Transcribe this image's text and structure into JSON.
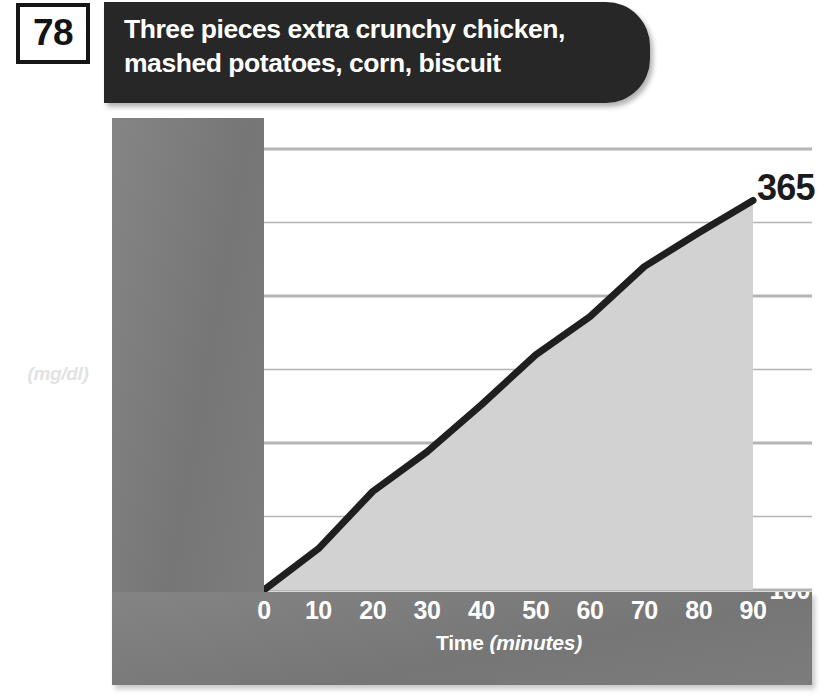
{
  "page": {
    "badge_number": "78",
    "title": "Three pieces extra crunchy chicken,\nmashed potatoes, corn, biscuit"
  },
  "axes": {
    "y_title": "Rise in\nBlood\nSugar",
    "y_units": "(mg/dl)",
    "x_title_main": "Time ",
    "x_title_units": "(minutes)"
  },
  "callout": {
    "end_value": "365"
  },
  "colors": {
    "header_band": "#272727",
    "chassis_gray": "#7b7b7b",
    "plot_background": "#ffffff",
    "area_fill": "#d2d2d2",
    "line_stroke": "#1f1f1f",
    "gridline": "#b4b4b4",
    "tick_text": "#ffffff",
    "callout_text": "#1b1b1b"
  },
  "chart_data": {
    "type": "area",
    "title": "Three pieces extra crunchy chicken, mashed potatoes, corn, biscuit",
    "xlabel": "Time (minutes)",
    "ylabel": "Rise in Blood Sugar (mg/dl)",
    "xlim": [
      0,
      90
    ],
    "ylim": [
      100,
      400
    ],
    "grid": true,
    "legend": "none",
    "x": [
      0,
      10,
      20,
      30,
      40,
      50,
      60,
      70,
      80,
      90
    ],
    "xticks": [
      "0",
      "10",
      "20",
      "30",
      "40",
      "50",
      "60",
      "70",
      "80",
      "90"
    ],
    "yticks": [
      "100",
      "150",
      "200",
      "250",
      "300",
      "350",
      "400"
    ],
    "values": [
      100,
      128,
      167,
      194,
      226,
      260,
      286,
      320,
      343,
      365
    ],
    "annotations": [
      {
        "text": "365",
        "x": 90,
        "y": 365
      }
    ]
  }
}
